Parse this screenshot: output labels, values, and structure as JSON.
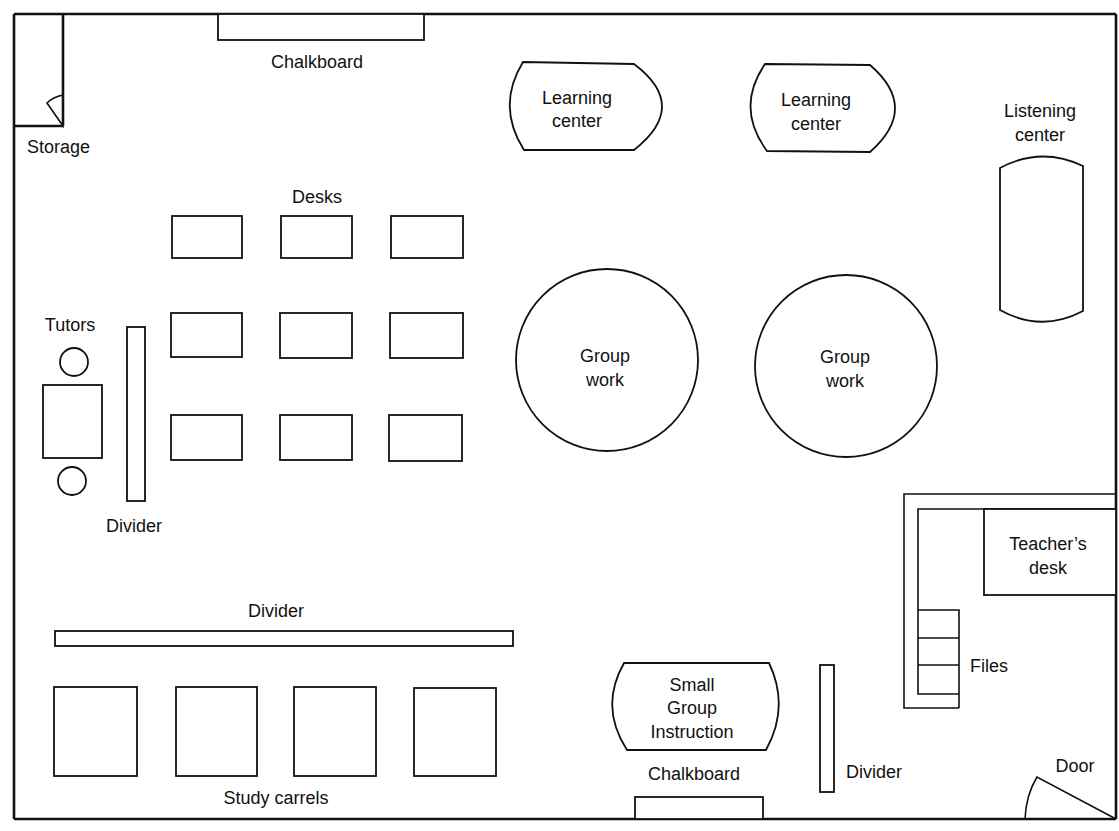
{
  "diagram": {
    "type": "classroom floor plan",
    "colors": {
      "ink": "#111111",
      "background": "#ffffff"
    },
    "labels": {
      "chalkboard_top": "Chalkboard",
      "storage": "Storage",
      "desks": "Desks",
      "learning_center_1": [
        "Learning",
        "center"
      ],
      "learning_center_2": [
        "Learning",
        "center"
      ],
      "listening_center": [
        "Listening",
        "center"
      ],
      "tutors": "Tutors",
      "divider_left": "Divider",
      "group_work_1": [
        "Group",
        "work"
      ],
      "group_work_2": [
        "Group",
        "work"
      ],
      "teachers_desk": [
        "Teacher’s",
        "desk"
      ],
      "files": "Files",
      "divider_long": "Divider",
      "study_carrels": "Study carrels",
      "small_group": [
        "Small",
        "Group",
        "Instruction"
      ],
      "chalkboard_bottom": "Chalkboard",
      "divider_bottom": "Divider",
      "door": "Door"
    },
    "counts": {
      "desks": 9,
      "study_carrels": 4,
      "file_drawers": 3,
      "tutor_chairs": 2,
      "group_tables": 2,
      "learning_centers": 2
    }
  }
}
